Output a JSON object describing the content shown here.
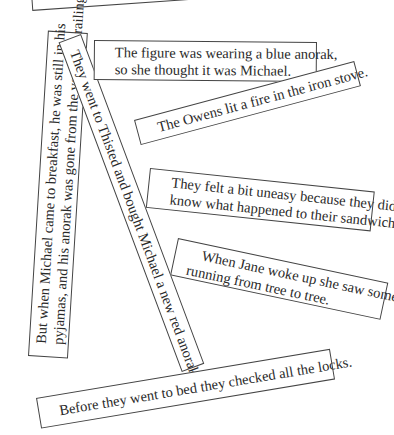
{
  "strips": [
    {
      "id": "top-cropped",
      "lines": [
        "anorak"
      ]
    },
    {
      "id": "figure-blue-anorak",
      "lines": [
        "The figure was wearing a blue anorak,",
        "so she thought it was Michael."
      ]
    },
    {
      "id": "owens-fire",
      "lines": [
        "The Owens lit a fire in the iron stove."
      ]
    },
    {
      "id": "uneasy-sandwiches",
      "lines": [
        "They felt a bit uneasy because they didn't",
        "know what happened to their sandwiches."
      ]
    },
    {
      "id": "jane-woke",
      "lines": [
        "When Jane woke up she saw someone",
        "running from tree to tree."
      ]
    },
    {
      "id": "michael-breakfast",
      "lines": [
        "But when Michael came to breakfast, he was still in his",
        "pyjamas, and his anorak was gone from the verandah railing."
      ]
    },
    {
      "id": "thisted-red-anorak",
      "lines": [
        "They went to Thisted and bought Michael a new red anorak."
      ]
    },
    {
      "id": "checked-locks",
      "lines": [
        "Before they went to bed they checked all the locks."
      ]
    }
  ]
}
